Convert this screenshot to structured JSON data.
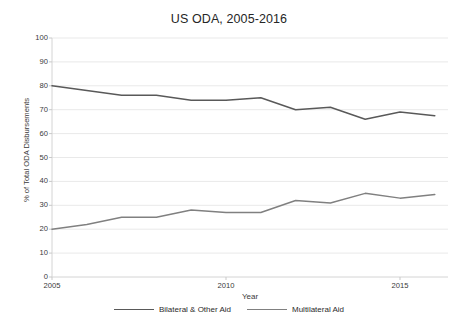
{
  "chart_data": {
    "type": "line",
    "title": "US ODA, 2005-2016",
    "xlabel": "Year",
    "ylabel": "% of Total ODA Disbursements",
    "x": [
      2005,
      2006,
      2007,
      2008,
      2009,
      2010,
      2011,
      2012,
      2013,
      2014,
      2015,
      2016
    ],
    "xlim": [
      2005,
      2016
    ],
    "ylim": [
      0,
      100
    ],
    "ytick_labels": [
      "0",
      "10",
      "20",
      "30",
      "40",
      "50",
      "60",
      "70",
      "80",
      "90",
      "100"
    ],
    "ytick_values": [
      0,
      10,
      20,
      30,
      40,
      50,
      60,
      70,
      80,
      90,
      100
    ],
    "xtick_labels": [
      "2005",
      "2010",
      "2015"
    ],
    "xtick_values": [
      2005,
      2010,
      2015
    ],
    "grid": "horizontal",
    "legend_position": "bottom",
    "series": [
      {
        "name": "Bilateral & Other Aid",
        "color": "#595959",
        "values": [
          80,
          78,
          76,
          76,
          74,
          74,
          75,
          70,
          71,
          66,
          69,
          67.5
        ]
      },
      {
        "name": "Multilateral Aid",
        "color": "#808080",
        "values": [
          20,
          22,
          25,
          25,
          28,
          27,
          27,
          32,
          31,
          35,
          33,
          34.5
        ]
      }
    ]
  },
  "caption": {
    "partial_text": ""
  }
}
